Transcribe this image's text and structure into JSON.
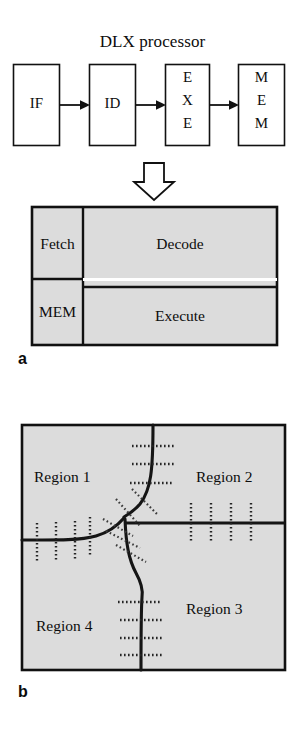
{
  "figure": {
    "panels": [
      {
        "key": "a",
        "label": "a",
        "caption_label": "a",
        "title": "DLX processor",
        "pipeline": {
          "stages": [
            {
              "id": "if",
              "label": "IF",
              "lines": [
                "IF"
              ]
            },
            {
              "id": "id",
              "label": "ID",
              "lines": [
                "ID"
              ]
            },
            {
              "id": "exe",
              "label": "EXE",
              "lines": [
                "E",
                "X",
                "E"
              ]
            },
            {
              "id": "mem",
              "label": "MEM",
              "lines": [
                "M",
                "E",
                "M"
              ]
            }
          ],
          "connector_count": 3,
          "connector_kind": "arrow-right"
        },
        "transform_arrow": {
          "kind": "arrow-down",
          "style": "hollow-outline"
        },
        "floorplan": {
          "blocks": [
            {
              "id": "fetch",
              "label": "Fetch"
            },
            {
              "id": "decode",
              "label": "Decode"
            },
            {
              "id": "mem",
              "label": "MEM"
            },
            {
              "id": "execute",
              "label": "Execute"
            }
          ],
          "fill_color": "#dcdcdc",
          "border_color": "#111111"
        }
      },
      {
        "key": "b",
        "label": "b",
        "caption_label": "b",
        "regions": [
          {
            "id": "r1",
            "label": "Region 1"
          },
          {
            "id": "r2",
            "label": "Region 2"
          },
          {
            "id": "r3",
            "label": "Region 3"
          },
          {
            "id": "r4",
            "label": "Region 4"
          }
        ],
        "fill_color": "#dcdcdc",
        "border_color": "#111111",
        "boundary_color": "#151515",
        "tick_marks": {
          "style": "dotted",
          "groups": [
            {
              "id": "top-vertical-boundary",
              "count": 3,
              "orientation": "horizontal"
            },
            {
              "id": "left-horizontal-boundary",
              "count": 4,
              "orientation": "vertical"
            },
            {
              "id": "right-horizontal-boundary",
              "count": 4,
              "orientation": "vertical"
            },
            {
              "id": "bottom-vertical-boundary",
              "count": 4,
              "orientation": "horizontal"
            },
            {
              "id": "junction-diagonals",
              "count": 5,
              "orientation": "diagonal"
            }
          ]
        }
      }
    ]
  }
}
